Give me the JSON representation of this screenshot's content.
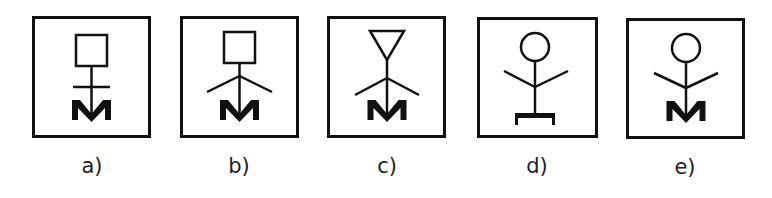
{
  "figure": {
    "options": [
      {
        "id": "a",
        "label": "a)",
        "head": "square",
        "arms": "horizontal-crossbar",
        "base": "M"
      },
      {
        "id": "b",
        "label": "b)",
        "head": "square",
        "arms": "angled-down",
        "base": "M"
      },
      {
        "id": "c",
        "label": "c)",
        "head": "inverted-triangle",
        "arms": "angled-down",
        "base": "M"
      },
      {
        "id": "d",
        "label": "d)",
        "head": "circle",
        "arms": "angled-up",
        "base": "bracket"
      },
      {
        "id": "e",
        "label": "e)",
        "head": "circle",
        "arms": "angled-up",
        "base": "M"
      }
    ],
    "base_letter": "M",
    "stroke_color": "#111111",
    "background_color": "#ffffff"
  }
}
